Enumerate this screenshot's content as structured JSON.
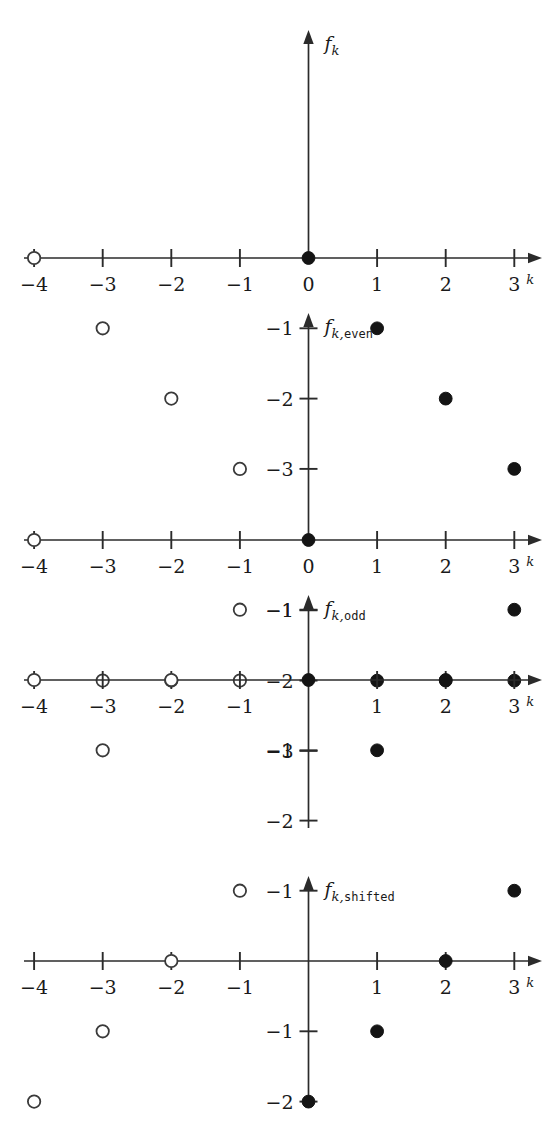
{
  "figure": {
    "title": "",
    "panel_count": 4,
    "x_axis_label": "k",
    "x_ticks": [
      -4,
      -3,
      -2,
      -1,
      0,
      1,
      2,
      3
    ],
    "x_tick_labels": [
      "−4",
      "−3",
      "−2",
      "−1",
      "0",
      "1",
      "2",
      "3"
    ],
    "marker_legend": {
      "open": "open circle (negative k / reflected samples)",
      "closed": "filled circle (non-negative k samples)"
    }
  },
  "chart_data": [
    {
      "type": "scatter",
      "title": "f_k",
      "axis_label_base": "f",
      "axis_label_sub": "k",
      "axis_label_sub2": "",
      "xlabel": "k",
      "ylabel": "f_k",
      "grid": false,
      "legend": "none",
      "xlim": [
        -4.4,
        3.6
      ],
      "ylim": [
        0,
        -3.4
      ],
      "x_ticks": [
        -4,
        -3,
        -2,
        -1,
        0,
        1,
        2,
        3
      ],
      "x_tick_labels": [
        "−4",
        "−3",
        "−2",
        "−1",
        "0",
        "1",
        "2",
        "3"
      ],
      "y_ticks": [
        -1,
        -2,
        -3
      ],
      "y_tick_labels": [
        "−1",
        "−2",
        "−3"
      ],
      "y_zero_label": "0",
      "series": [
        {
          "name": "open",
          "marker": "open-circle",
          "points": [
            {
              "x": -4,
              "y": 0
            },
            {
              "x": -3,
              "y": -1
            },
            {
              "x": -2,
              "y": -2
            },
            {
              "x": -1,
              "y": -3
            }
          ]
        },
        {
          "name": "closed",
          "marker": "filled-circle",
          "points": [
            {
              "x": 0,
              "y": 0
            },
            {
              "x": 1,
              "y": -1
            },
            {
              "x": 2,
              "y": -2
            },
            {
              "x": 3,
              "y": -3
            }
          ]
        }
      ]
    },
    {
      "type": "scatter",
      "title": "f_k,even",
      "axis_label_base": "f",
      "axis_label_sub": "k,",
      "axis_label_sub2": "even",
      "xlabel": "k",
      "ylabel": "f_k,even",
      "grid": false,
      "legend": "none",
      "xlim": [
        -4.4,
        3.6
      ],
      "ylim": [
        0,
        -3.4
      ],
      "x_ticks": [
        -4,
        -3,
        -2,
        -1,
        0,
        1,
        2,
        3
      ],
      "x_tick_labels": [
        "−4",
        "−3",
        "−2",
        "−1",
        "0",
        "1",
        "2",
        "3"
      ],
      "y_ticks": [
        -1,
        -2,
        -3
      ],
      "y_tick_labels": [
        "−1",
        "−2",
        "−3"
      ],
      "y_zero_label": "0",
      "series": [
        {
          "name": "open",
          "marker": "open-circle",
          "points": [
            {
              "x": -4,
              "y": 0
            },
            {
              "x": -3,
              "y": -2
            },
            {
              "x": -2,
              "y": -2
            },
            {
              "x": -1,
              "y": -2
            }
          ]
        },
        {
          "name": "closed",
          "marker": "filled-circle",
          "points": [
            {
              "x": 0,
              "y": 0
            },
            {
              "x": 1,
              "y": -2
            },
            {
              "x": 2,
              "y": -2
            },
            {
              "x": 3,
              "y": -2
            }
          ]
        }
      ]
    },
    {
      "type": "scatter",
      "title": "f_k,odd",
      "axis_label_base": "f",
      "axis_label_sub": "k,",
      "axis_label_sub2": "odd",
      "xlabel": "k",
      "ylabel": "f_k,odd",
      "grid": false,
      "legend": "none",
      "xlim": [
        -4.4,
        3.6
      ],
      "ylim": [
        -2.4,
        1.4
      ],
      "x_ticks": [
        -4,
        -3,
        -2,
        -1,
        1,
        2,
        3
      ],
      "x_tick_labels": [
        "−4",
        "−3",
        "−2",
        "−1",
        "1",
        "2",
        "3"
      ],
      "y_ticks": [
        1,
        -1,
        -2
      ],
      "y_tick_labels": [
        "−1",
        "−1",
        "−2"
      ],
      "y_zero_label": "",
      "series": [
        {
          "name": "open",
          "marker": "open-circle",
          "points": [
            {
              "x": -4,
              "y": 0
            },
            {
              "x": -3,
              "y": -1
            },
            {
              "x": -2,
              "y": 0
            },
            {
              "x": -1,
              "y": 1
            }
          ]
        },
        {
          "name": "closed",
          "marker": "filled-circle",
          "points": [
            {
              "x": 0,
              "y": 0
            },
            {
              "x": 1,
              "y": -1
            },
            {
              "x": 2,
              "y": 0
            },
            {
              "x": 3,
              "y": 1
            }
          ]
        }
      ]
    },
    {
      "type": "scatter",
      "title": "f_k,shifted",
      "axis_label_base": "f",
      "axis_label_sub": "k,",
      "axis_label_sub2": "shifted",
      "xlabel": "k",
      "ylabel": "f_k,shifted",
      "grid": false,
      "legend": "none",
      "xlim": [
        -4.4,
        3.6
      ],
      "ylim": [
        -2.4,
        1.4
      ],
      "x_ticks": [
        -4,
        -3,
        -2,
        -1,
        1,
        2,
        3
      ],
      "x_tick_labels": [
        "−4",
        "−3",
        "−2",
        "−1",
        "1",
        "2",
        "3"
      ],
      "y_ticks": [
        1,
        -1,
        -2
      ],
      "y_tick_labels": [
        "−1",
        "−1",
        "−2"
      ],
      "y_zero_label": "",
      "series": [
        {
          "name": "open",
          "marker": "open-circle",
          "points": [
            {
              "x": -4,
              "y": -2
            },
            {
              "x": -3,
              "y": -1
            },
            {
              "x": -2,
              "y": 0
            },
            {
              "x": -1,
              "y": 1
            }
          ]
        },
        {
          "name": "closed",
          "marker": "filled-circle",
          "points": [
            {
              "x": 0,
              "y": -2
            },
            {
              "x": 1,
              "y": -1
            },
            {
              "x": 2,
              "y": 0
            },
            {
              "x": 3,
              "y": 1
            }
          ]
        }
      ]
    }
  ]
}
